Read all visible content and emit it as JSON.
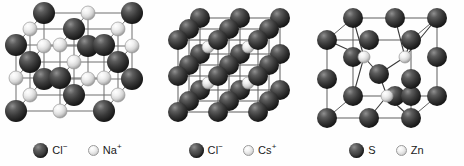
{
  "figure": {
    "background_color": "#fefefe",
    "anion_color": "#3b3b3b",
    "cation_color": "#e2e2e2",
    "bond_color": "#6b6b6b"
  },
  "panels": [
    {
      "id": "nacl",
      "structure_name": "rock-salt",
      "legend": [
        {
          "species": "anion",
          "label": "Cl",
          "charge": "−"
        },
        {
          "species": "cation",
          "label": "Na",
          "charge": "+"
        }
      ]
    },
    {
      "id": "cscl",
      "structure_name": "caesium-chloride",
      "legend": [
        {
          "species": "anion",
          "label": "Cl",
          "charge": "−"
        },
        {
          "species": "cation",
          "label": "Cs",
          "charge": "+"
        }
      ]
    },
    {
      "id": "zns",
      "structure_name": "zinc-blende",
      "legend": [
        {
          "species": "anion",
          "label": "S",
          "charge": ""
        },
        {
          "species": "cation",
          "label": "Zn",
          "charge": ""
        }
      ]
    }
  ]
}
